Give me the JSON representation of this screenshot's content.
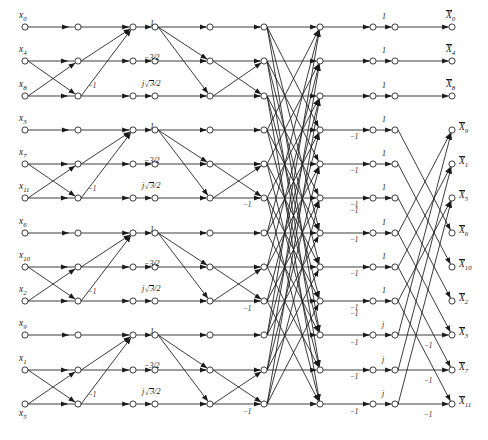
{
  "figure": {
    "kind": "signal-flow-graph",
    "background_color": "#ffffff",
    "line_color": "#1a1a1a",
    "node_fill": "#ffffff"
  },
  "geometry": {
    "width": 488,
    "height": 440,
    "row_y": [
      27,
      61,
      96,
      130,
      164,
      198,
      233,
      267,
      301,
      335,
      370,
      404
    ],
    "col_x": [
      25,
      78,
      133,
      155,
      210,
      264,
      320,
      373,
      395,
      452
    ],
    "node_radius": 3.1,
    "group_size": 3,
    "group_count": 4
  },
  "inputs": [
    {
      "base": "x",
      "sub": "0",
      "row": 0
    },
    {
      "base": "x",
      "sub": "4",
      "row": 1
    },
    {
      "base": "x",
      "sub": "8",
      "row": 2
    },
    {
      "base": "x",
      "sub": "3",
      "row": 3
    },
    {
      "base": "x",
      "sub": "7",
      "row": 4
    },
    {
      "base": "x",
      "sub": "11",
      "row": 5
    },
    {
      "base": "x",
      "sub": "6",
      "row": 6
    },
    {
      "base": "x",
      "sub": "10",
      "row": 7
    },
    {
      "base": "x",
      "sub": "2",
      "row": 8
    },
    {
      "base": "x",
      "sub": "9",
      "row": 9
    },
    {
      "base": "x",
      "sub": "1",
      "row": 10
    },
    {
      "base": "x",
      "sub": "5",
      "row": 11
    }
  ],
  "outputs": [
    {
      "base": "X",
      "sub": "0",
      "row": 0,
      "overline": true
    },
    {
      "base": "X",
      "sub": "4",
      "row": 1,
      "overline": true
    },
    {
      "base": "X",
      "sub": "8",
      "row": 2,
      "overline": true
    },
    {
      "base": "X",
      "sub": "9",
      "row": 3,
      "overline": true
    },
    {
      "base": "X",
      "sub": "1",
      "row": 4,
      "overline": true
    },
    {
      "base": "X",
      "sub": "5",
      "row": 5,
      "overline": true
    },
    {
      "base": "X",
      "sub": "6",
      "row": 6,
      "overline": true
    },
    {
      "base": "X",
      "sub": "10",
      "row": 7,
      "overline": true
    },
    {
      "base": "X",
      "sub": "2",
      "row": 8,
      "overline": true
    },
    {
      "base": "X",
      "sub": "3",
      "row": 9,
      "overline": true
    },
    {
      "base": "X",
      "sub": "7",
      "row": 10,
      "overline": true
    },
    {
      "base": "X",
      "sub": "11",
      "row": 11,
      "overline": true
    }
  ],
  "coefficients": {
    "one": "1",
    "j": "j",
    "neg_one": "−1",
    "neg_three_halves": "−3/2",
    "j_root3_over_2_num": "3",
    "j_root3_over_2_den": "/2",
    "j_prefix": "j"
  },
  "stage_labels": {
    "group_top_coef": "1",
    "group_mid_coef": "−3/2",
    "group_bot_coef_prefix": "j",
    "group_bot_coef_rad": "3",
    "group_bot_coef_tail": "/2",
    "butterfly_minus_one": "−1",
    "final_one": "1",
    "final_j": "j",
    "final_minus_one": "−1"
  },
  "annotations": [
    {
      "text": "1",
      "x": 150,
      "y": 20,
      "style": "coef",
      "name": "coef-1-g1"
    },
    {
      "text": "−3/2",
      "x": 144,
      "y": 54,
      "style": "coef",
      "name": "coef-neg32-g1"
    },
    {
      "text": "−1",
      "x": 88,
      "y": 83,
      "style": "coef-sm",
      "name": "coef-neg1-g1"
    },
    {
      "text": "1",
      "x": 150,
      "y": 123,
      "style": "coef",
      "name": "coef-1-g2"
    },
    {
      "text": "−3/2",
      "x": 144,
      "y": 157,
      "style": "coef",
      "name": "coef-neg32-g2"
    },
    {
      "text": "−1",
      "x": 88,
      "y": 186,
      "style": "coef-sm",
      "name": "coef-neg1-g2"
    },
    {
      "text": "1",
      "x": 150,
      "y": 226,
      "style": "coef",
      "name": "coef-1-g3"
    },
    {
      "text": "−3/2",
      "x": 144,
      "y": 260,
      "style": "coef",
      "name": "coef-neg32-g3"
    },
    {
      "text": "−1",
      "x": 88,
      "y": 289,
      "style": "coef-sm",
      "name": "coef-neg1-g3"
    },
    {
      "text": "1",
      "x": 150,
      "y": 328,
      "style": "coef",
      "name": "coef-1-g4"
    },
    {
      "text": "−3/2",
      "x": 144,
      "y": 362,
      "style": "coef",
      "name": "coef-neg32-g4"
    },
    {
      "text": "−1",
      "x": 88,
      "y": 392,
      "style": "coef-sm",
      "name": "coef-neg1-g4"
    }
  ],
  "minus_one_marks": [
    {
      "x": 243,
      "y": 202,
      "name": "minus-one-mid-a"
    },
    {
      "x": 243,
      "y": 306,
      "name": "minus-one-mid-b"
    },
    {
      "x": 243,
      "y": 409,
      "name": "minus-one-mid-c"
    },
    {
      "x": 350,
      "y": 134,
      "name": "minus-one-bfly-1"
    },
    {
      "x": 350,
      "y": 168,
      "name": "minus-one-bfly-2"
    },
    {
      "x": 350,
      "y": 202,
      "name": "minus-one-bfly-3"
    },
    {
      "x": 350,
      "y": 208,
      "name": "minus-one-bfly-4"
    },
    {
      "x": 350,
      "y": 237,
      "name": "minus-one-bfly-5"
    },
    {
      "x": 350,
      "y": 271,
      "name": "minus-one-bfly-6"
    },
    {
      "x": 350,
      "y": 305,
      "name": "minus-one-bfly-7"
    },
    {
      "x": 350,
      "y": 311,
      "name": "minus-one-bfly-8"
    },
    {
      "x": 350,
      "y": 340,
      "name": "minus-one-bfly-9"
    },
    {
      "x": 350,
      "y": 374,
      "name": "minus-one-bfly-10"
    },
    {
      "x": 350,
      "y": 409,
      "name": "minus-one-bfly-11"
    },
    {
      "x": 424,
      "y": 343,
      "name": "minus-one-out-3"
    },
    {
      "x": 424,
      "y": 378,
      "name": "minus-one-out-7"
    },
    {
      "x": 424,
      "y": 412,
      "name": "minus-one-out-11"
    }
  ],
  "final_col_labels": [
    "1",
    "1",
    "1",
    "1",
    "1",
    "1",
    "1",
    "1",
    "1",
    "j",
    "j",
    "j"
  ]
}
